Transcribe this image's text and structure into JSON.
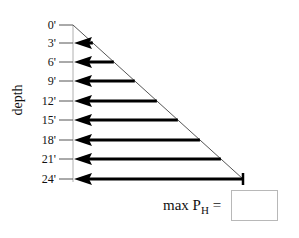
{
  "diagram": {
    "axis_title": "depth",
    "depth_labels": [
      "0'",
      "3'",
      "6'",
      "9'",
      "12'",
      "15'",
      "18'",
      "21'",
      "24'"
    ],
    "answer": {
      "prefix": "max P",
      "subscript": "H",
      "suffix": " =",
      "value": ""
    },
    "colors": {
      "arrow": "#000000",
      "line": "#555555",
      "box_border": "#b8b8b8"
    }
  }
}
